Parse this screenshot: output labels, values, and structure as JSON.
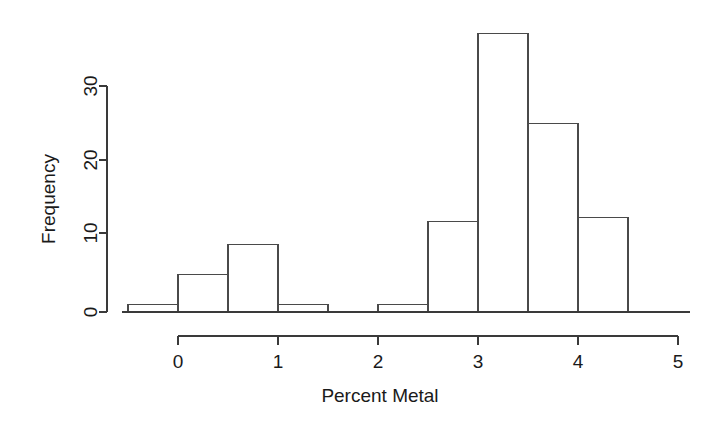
{
  "chart_data": {
    "type": "bar",
    "title": "",
    "subtitle": "",
    "xlabel": "Percent Metal",
    "ylabel": "Frequency",
    "xlim": [
      -0.65,
      5.1
    ],
    "ylim": [
      0,
      38
    ],
    "xticks": [
      0,
      1,
      2,
      3,
      4,
      5
    ],
    "xtick_labels": [
      "0",
      "1",
      "2",
      "3",
      "4",
      "5"
    ],
    "yticks": [
      0,
      10,
      20,
      30
    ],
    "ytick_labels": [
      "0",
      "10",
      "20",
      "30"
    ],
    "grid": false,
    "legend": null,
    "bin_width": 0.5,
    "bin_edges": [
      -0.5,
      0,
      0.5,
      1,
      1.5,
      2,
      2.5,
      3,
      3.5,
      4,
      4.5
    ],
    "categories": [
      "-0.5 to 0",
      "0 to 0.5",
      "0.5 to 1",
      "1 to 1.5",
      "1.5 to 2",
      "2 to 2.5",
      "2.5 to 3",
      "3 to 3.5",
      "3.5 to 4",
      "4 to 4.5"
    ],
    "values": [
      1,
      5,
      9,
      1,
      0,
      1,
      12,
      37,
      25,
      12.5
    ],
    "bar_fill": "#ffffff",
    "bar_stroke": "#4a4a4a",
    "axis_color": "#3a3a3a",
    "background": "#ffffff"
  },
  "figure": {
    "xaxis_title": "Percent Metal",
    "yaxis_title": "Frequency"
  }
}
